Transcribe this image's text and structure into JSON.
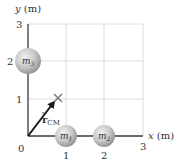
{
  "axes": {
    "x_label": "x (m)",
    "y_label": "y (m)",
    "origin_label": "0",
    "x_ticks": [
      "1",
      "2",
      "3"
    ],
    "y_ticks": [
      "1",
      "2",
      "3"
    ]
  },
  "masses": [
    {
      "label": "m",
      "sub": "1",
      "x": 1,
      "y": 0
    },
    {
      "label": "m",
      "sub": "2",
      "x": 2,
      "y": 0
    },
    {
      "label": "m",
      "sub": "3",
      "x": 0,
      "y": 2
    }
  ],
  "center_of_mass": {
    "vector_label": "r",
    "vector_sub": "CM",
    "x": 0.75,
    "y": 1.0,
    "marker": "×"
  },
  "colors": {
    "axis": "#3a3a3a",
    "grid": "#dcdcdc",
    "sphere_light": "#e6e6e6",
    "sphere_dark": "#9a9a9a",
    "arrow": "#1a1a1a",
    "cm_marker": "#777777"
  }
}
